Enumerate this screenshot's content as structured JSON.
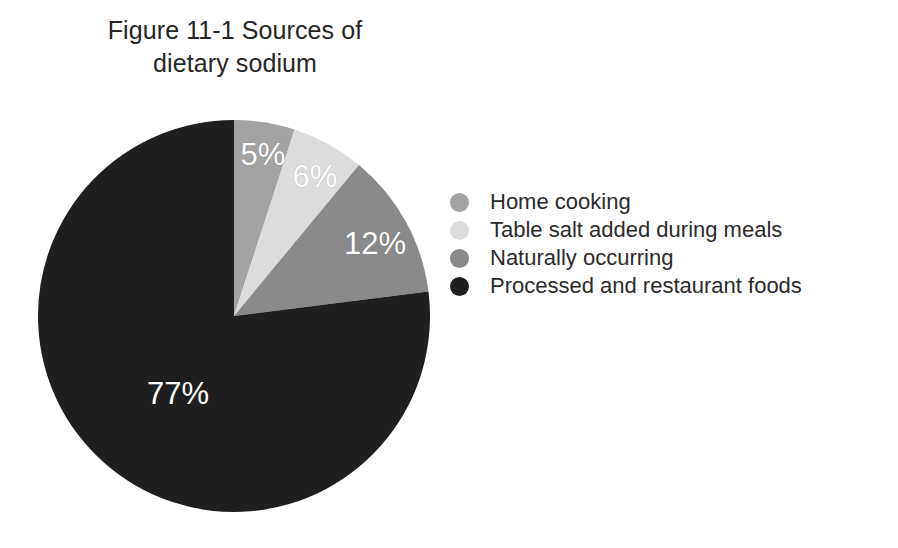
{
  "chart_data": {
    "type": "pie",
    "title": "Figure 11-1 Sources of dietary sodium",
    "title_lines": [
      "Figure 11-1 Sources of",
      "dietary sodium"
    ],
    "categories": [
      "Home cooking",
      "Table salt added during meals",
      "Naturally occurring",
      "Processed and restaurant foods"
    ],
    "values": [
      5,
      6,
      12,
      77
    ],
    "value_labels": [
      "5%",
      "6%",
      "12%",
      "77%"
    ],
    "colors": [
      "#a3a3a3",
      "#dcdcdc",
      "#8a8a8a",
      "#1f1f1f"
    ],
    "label_color": "#ffffff",
    "xlabel": "",
    "ylabel": "",
    "units": "percent",
    "start_angle_deg": 0,
    "direction": "clockwise",
    "legend_position": "right",
    "grid": false,
    "background": "#ffffff"
  },
  "legend": {
    "items": [
      {
        "label": "Home cooking",
        "color": "#a3a3a3",
        "swatch_name": "legend-swatch-home-cooking"
      },
      {
        "label": "Table salt added during meals",
        "color": "#dcdcdc",
        "swatch_name": "legend-swatch-table-salt"
      },
      {
        "label": "Naturally occurring",
        "color": "#8a8a8a",
        "swatch_name": "legend-swatch-naturally-occurring"
      },
      {
        "label": "Processed and restaurant foods",
        "color": "#1f1f1f",
        "swatch_name": "legend-swatch-processed-foods"
      }
    ]
  }
}
